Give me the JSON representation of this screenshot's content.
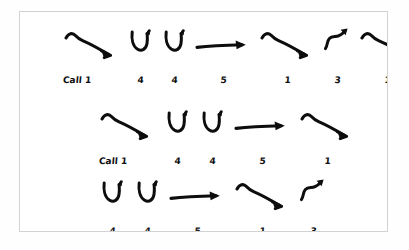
{
  "page": {
    "background_color": "#ffffff",
    "sheet_border_color": "#d2d2d2",
    "ink_color": "#0d0d0d"
  },
  "notation": {
    "symbol_names": {
      "fall": "falling-arrow",
      "scoop": "scoop-arrow",
      "level": "level-arrow",
      "rise": "rising-arrow"
    },
    "rows": [
      {
        "id": "row-1",
        "cells": [
          {
            "label": "Call 1",
            "symbol": "fall"
          },
          {
            "label": "4",
            "symbol": "scoop"
          },
          {
            "label": "4",
            "symbol": "scoop"
          },
          {
            "label": "5",
            "symbol": "level"
          },
          {
            "label": "1",
            "symbol": "fall"
          },
          {
            "label": "3",
            "symbol": "rise"
          },
          {
            "label": "1",
            "symbol": "fall"
          },
          {
            "label": "4",
            "symbol": "scoop"
          }
        ]
      },
      {
        "id": "row-2",
        "cells": [
          {
            "label": "Call 1",
            "symbol": "fall"
          },
          {
            "label": "4",
            "symbol": "scoop"
          },
          {
            "label": "4",
            "symbol": "scoop"
          },
          {
            "label": "5",
            "symbol": "level"
          },
          {
            "label": "1",
            "symbol": "fall"
          }
        ]
      },
      {
        "id": "row-3",
        "cells": [
          {
            "label": "4",
            "symbol": "scoop"
          },
          {
            "label": "4",
            "symbol": "scoop"
          },
          {
            "label": "5",
            "symbol": "level"
          },
          {
            "label": "1",
            "symbol": "fall"
          },
          {
            "label": "3",
            "symbol": "rise"
          }
        ]
      }
    ]
  }
}
